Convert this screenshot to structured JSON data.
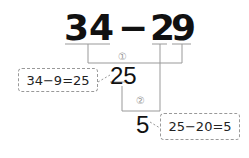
{
  "expression": {
    "tens_ones_left": "34",
    "operator": "−",
    "right_tens": "2",
    "right_ones": "9"
  },
  "steps": {
    "step1_label": "①",
    "step1_result": "25",
    "step1_note": "34−9=25",
    "step2_label": "②",
    "step2_result": "5",
    "step2_note": "25−20=5"
  }
}
